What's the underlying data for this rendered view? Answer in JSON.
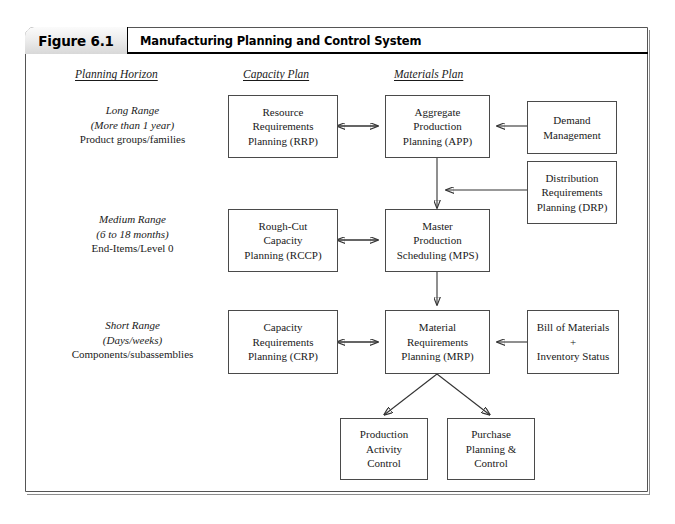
{
  "figure": {
    "tab_label": "Figure 6.1",
    "title": "Manufacturing Planning and Control System"
  },
  "column_headers": [
    {
      "label": "Planning Horizon"
    },
    {
      "label": "Capacity Plan"
    },
    {
      "label": "Materials Plan"
    }
  ],
  "row_labels": [
    {
      "line1": "Long Range",
      "line2": "(More than 1 year)",
      "line3": "Product groups/families"
    },
    {
      "line1": "Medium Range",
      "line2": "(6 to 18 months)",
      "line3": "End-Items/Level 0"
    },
    {
      "line1": "Short Range",
      "line2": "(Days/weeks)",
      "line3": "Components/subassemblies"
    }
  ],
  "boxes": {
    "rrp": {
      "line1": "Resource",
      "line2": "Requirements",
      "line3": "Planning (RRP)"
    },
    "app": {
      "line1": "Aggregate",
      "line2": "Production",
      "line3": "Planning (APP)"
    },
    "demand": {
      "line1": "Demand",
      "line2": "Management",
      "line3": ""
    },
    "drp": {
      "line1": "Distribution",
      "line2": "Requirements",
      "line3": "Planning (DRP)"
    },
    "rccp": {
      "line1": "Rough-Cut",
      "line2": "Capacity",
      "line3": "Planning (RCCP)"
    },
    "mps": {
      "line1": "Master",
      "line2": "Production",
      "line3": "Scheduling (MPS)"
    },
    "crp": {
      "line1": "Capacity",
      "line2": "Requirements",
      "line3": "Planning (CRP)"
    },
    "mrp": {
      "line1": "Material",
      "line2": "Requirements",
      "line3": "Planning (MRP)"
    },
    "bom": {
      "line1": "Bill of Materials",
      "line2": "+",
      "line3": "Inventory Status"
    },
    "pac": {
      "line1": "Production",
      "line2": "Activity",
      "line3": "Control"
    },
    "ppc": {
      "line1": "Purchase",
      "line2": "Planning &",
      "line3": "Control"
    }
  },
  "colors": {
    "box_border": "#4a4a4a",
    "connector": "#333333",
    "frame_border": "#555555",
    "header_rule": "#000000"
  }
}
